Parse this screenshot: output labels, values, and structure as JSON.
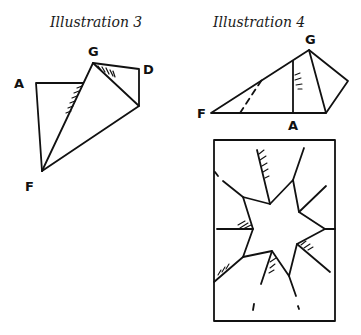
{
  "illustrations": [
    {
      "title": "Illustration 3",
      "labels": {
        "A": "A",
        "G": "G",
        "D": "D",
        "F": "F"
      }
    },
    {
      "title": "Illustration 4",
      "labels": {
        "G": "G",
        "F": "F",
        "A": "A"
      }
    },
    {
      "title": "",
      "description": "Six-pointed star cut-out in rectangular frame"
    }
  ]
}
